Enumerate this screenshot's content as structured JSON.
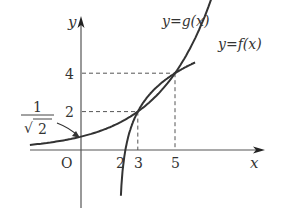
{
  "diagram": {
    "axes": {
      "x_label": "x",
      "y_label": "y",
      "origin_label": "O"
    },
    "x_ticks": [
      "2",
      "3",
      "5"
    ],
    "y_ticks": [
      "2",
      "4"
    ],
    "intercept_label": {
      "numerator": "1",
      "denominator": "2",
      "radical": "√"
    },
    "curves": [
      {
        "name": "f",
        "label": "y=f(x)",
        "type": "exponential",
        "formula": "2^((x-1)/2)"
      },
      {
        "name": "g",
        "label": "y=g(x)",
        "type": "logarithmic",
        "vertical_asymptote": 2
      }
    ],
    "intersection_points": [
      {
        "x": 3,
        "y": 2
      },
      {
        "x": 5,
        "y": 4
      }
    ],
    "colors": {
      "curve": "#333333",
      "axis": "#444444",
      "dashed": "#555555"
    }
  }
}
